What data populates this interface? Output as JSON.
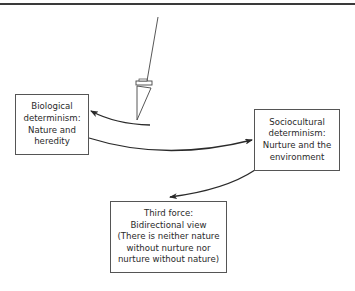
{
  "diagram": {
    "colors": {
      "line": "#2a2a2a",
      "box_border": "#555555",
      "text": "#2a2a2a"
    },
    "nodes": [
      {
        "id": "biological",
        "lines": [
          "Biological",
          "determinism:",
          "Nature and",
          "heredity"
        ]
      },
      {
        "id": "sociocultural",
        "lines": [
          "Sociocultural",
          "determinism:",
          "Nurture and the",
          "environment"
        ]
      },
      {
        "id": "third_force",
        "lines": [
          "Third force:",
          "Bidirectional view",
          "(There is neither nature",
          "without nurture nor",
          "nurture without nature)"
        ]
      }
    ],
    "edges": [
      {
        "from": "pendulum",
        "to": "biological"
      },
      {
        "from": "biological",
        "to": "sociocultural"
      },
      {
        "from": "sociocultural",
        "to": "third_force"
      }
    ],
    "icons": {
      "pendulum": "pendulum-icon"
    }
  }
}
